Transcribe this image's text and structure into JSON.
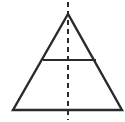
{
  "figure": {
    "canvas": {
      "width": 125,
      "height": 122,
      "background_color": "#ffffff"
    },
    "stroke_color": "#2a2a2a",
    "shapes": {
      "triangle": {
        "label": "triangle-outline",
        "apex": {
          "x": 68,
          "y": 14
        },
        "base_left": {
          "x": 13,
          "y": 110
        },
        "base_right": {
          "x": 122,
          "y": 110
        },
        "points": "68,14 13,110 122,110",
        "stroke_width": 2.4,
        "fill": "none"
      },
      "horizontal_divider": {
        "label": "horizontal-midline",
        "x1": 43,
        "y1": 60,
        "x2": 96,
        "y2": 60,
        "stroke_width": 2.2
      },
      "axis_of_symmetry": {
        "label": "vertical-dashed-axis",
        "x1": 68,
        "y1": 2,
        "x2": 68,
        "y2": 120,
        "stroke_width": 2.0,
        "dash_length": 5,
        "dash_gap": 4,
        "dash_array": "5 4"
      }
    }
  }
}
